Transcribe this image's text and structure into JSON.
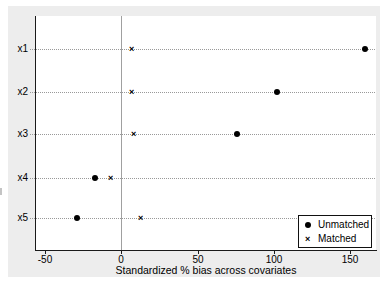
{
  "chart_data": {
    "type": "scatter",
    "title": "",
    "xlabel": "Standardized % bias across covariates",
    "ylabel": "",
    "categories": [
      "x1",
      "x2",
      "x3",
      "x4",
      "x5"
    ],
    "series": [
      {
        "name": "Unmatched",
        "marker": "circle",
        "values": [
          160,
          102,
          76,
          -17,
          -29
        ]
      },
      {
        "name": "Matched",
        "marker": "x",
        "values": [
          7,
          7,
          8,
          -7,
          13
        ]
      }
    ],
    "xticks": [
      -50,
      0,
      50,
      100,
      150
    ],
    "xtick_labels": [
      "-50",
      "0",
      "50",
      "100",
      "150"
    ],
    "xlim": [
      -56.6,
      167
    ],
    "refline_x": 0,
    "grid": "horizontal-dotted",
    "legend_position": "bottom-right"
  },
  "colors": {
    "figure_bg": "#ededed",
    "plot_bg": "#ffffff",
    "axis": "#1a1a1a",
    "grid": "#999999",
    "refline": "#a0a0a0",
    "marker": "#000000",
    "legend_bg": "#ffffff",
    "legend_border": "#111111",
    "text": "#000000"
  }
}
